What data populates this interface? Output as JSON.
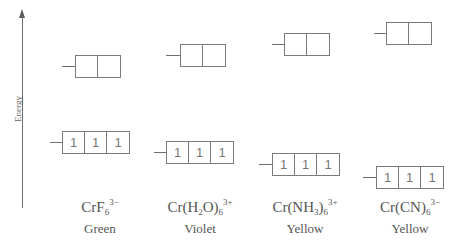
{
  "axis": {
    "label": "Energy",
    "direction": "up"
  },
  "complexes": [
    {
      "formula": {
        "base": "CrF",
        "sub1": "6",
        "mid": "",
        "sub2": "",
        "tail": "",
        "sup": "3−"
      },
      "color": "Green",
      "eg": {
        "x": 75,
        "y": 55,
        "tick_x": 62,
        "electrons": [
          "",
          ""
        ]
      },
      "t2g": {
        "x": 62,
        "y": 131,
        "tick_x": 50,
        "electrons": [
          "1",
          "1",
          "1"
        ]
      },
      "label_x": 100
    },
    {
      "formula": {
        "base": "Cr(H",
        "sub1": "2",
        "mid": "O)",
        "sub2": "6",
        "tail": "",
        "sup": "3+"
      },
      "color": "Violet",
      "eg": {
        "x": 180,
        "y": 44,
        "tick_x": 166,
        "electrons": [
          "",
          ""
        ]
      },
      "t2g": {
        "x": 166,
        "y": 141,
        "tick_x": 154,
        "electrons": [
          "1",
          "1",
          "1"
        ]
      },
      "label_x": 200
    },
    {
      "formula": {
        "base": "Cr(NH",
        "sub1": "3",
        "mid": ")",
        "sub2": "6",
        "tail": "",
        "sup": "3+"
      },
      "color": "Yellow",
      "eg": {
        "x": 284,
        "y": 33,
        "tick_x": 272,
        "electrons": [
          "",
          ""
        ]
      },
      "t2g": {
        "x": 272,
        "y": 153,
        "tick_x": 259,
        "electrons": [
          "1",
          "1",
          "1"
        ]
      },
      "label_x": 305
    },
    {
      "formula": {
        "base": "Cr(CN)",
        "sub1": "6",
        "mid": "",
        "sub2": "",
        "tail": "",
        "sup": "3−"
      },
      "color": "Yellow",
      "eg": {
        "x": 386,
        "y": 22,
        "tick_x": 374,
        "electrons": [
          "",
          ""
        ]
      },
      "t2g": {
        "x": 376,
        "y": 166,
        "tick_x": 363,
        "electrons": [
          "1",
          "1",
          "1"
        ]
      },
      "label_x": 410
    }
  ],
  "style": {
    "line_color": "#7a7a7a",
    "text_color": "#555555"
  }
}
